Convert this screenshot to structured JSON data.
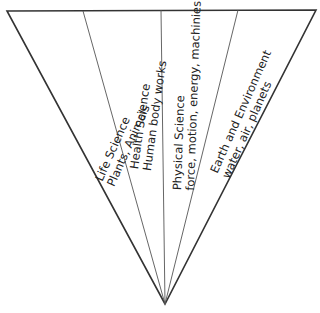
{
  "diagram": {
    "type": "inverted-triangle-funnel",
    "line_color": "#333333",
    "segments": [
      {
        "title": "Life Science",
        "subtitle": "Plants, Animals"
      },
      {
        "title": "Health Science",
        "subtitle": "Human body works"
      },
      {
        "title": "Physical Science",
        "subtitle": "force, motion, energy, machinies"
      },
      {
        "title": "Earth and Environment",
        "subtitle": "water, air, planets"
      }
    ]
  }
}
